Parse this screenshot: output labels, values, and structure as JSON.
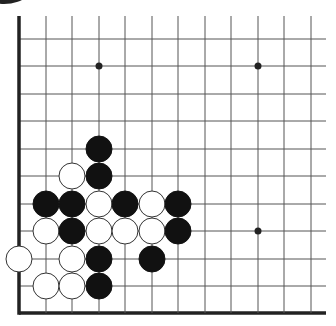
{
  "board": {
    "size_visible_cols": 12,
    "size_visible_rows": 11,
    "background": "#ffffff",
    "line_color": "#555555",
    "edge_color": "#222222",
    "columns_x": [
      19,
      46,
      72,
      99,
      125,
      152,
      178,
      205,
      231,
      258,
      284,
      311
    ],
    "rows_y": [
      39,
      66,
      94,
      121,
      149,
      176,
      204,
      231,
      259,
      286,
      313
    ],
    "edges": [
      "left",
      "bottom"
    ],
    "stone_radius": 13,
    "star_points": [
      {
        "col": 3,
        "row": 1
      },
      {
        "col": 9,
        "row": 1
      },
      {
        "col": 9,
        "row": 7
      }
    ],
    "stones": [
      {
        "color": "black",
        "col": 3,
        "row": 4
      },
      {
        "color": "white",
        "col": 2,
        "row": 5
      },
      {
        "color": "black",
        "col": 3,
        "row": 5
      },
      {
        "color": "black",
        "col": 1,
        "row": 6
      },
      {
        "color": "black",
        "col": 2,
        "row": 6
      },
      {
        "color": "white",
        "col": 3,
        "row": 6
      },
      {
        "color": "black",
        "col": 4,
        "row": 6
      },
      {
        "color": "white",
        "col": 5,
        "row": 6
      },
      {
        "color": "black",
        "col": 6,
        "row": 6
      },
      {
        "color": "white",
        "col": 1,
        "row": 7
      },
      {
        "color": "black",
        "col": 2,
        "row": 7
      },
      {
        "color": "white",
        "col": 3,
        "row": 7
      },
      {
        "color": "white",
        "col": 4,
        "row": 7
      },
      {
        "color": "white",
        "col": 5,
        "row": 7
      },
      {
        "color": "black",
        "col": 6,
        "row": 7
      },
      {
        "color": "white",
        "col": 0,
        "row": 8
      },
      {
        "color": "white",
        "col": 2,
        "row": 8
      },
      {
        "color": "black",
        "col": 3,
        "row": 8
      },
      {
        "color": "black",
        "col": 5,
        "row": 8
      },
      {
        "color": "white",
        "col": 1,
        "row": 9
      },
      {
        "color": "white",
        "col": 2,
        "row": 9
      },
      {
        "color": "black",
        "col": 3,
        "row": 9
      }
    ],
    "corner_marker": {
      "color": "black",
      "cx": 4,
      "cy": -26,
      "r": 30
    }
  }
}
